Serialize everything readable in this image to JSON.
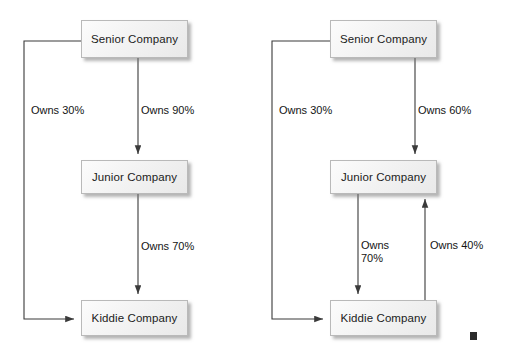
{
  "diagram": {
    "line_color": "#3a3a3a",
    "box_fill": "#f2f2f2",
    "box_border": "#b9b9b9",
    "text_color": "#1b1b1b",
    "panels": [
      {
        "id": "left-panel",
        "name": "left-diagram",
        "nodes": [
          {
            "id": "left-senior",
            "label": "Senior Company"
          },
          {
            "id": "left-junior",
            "label": "Junior Company"
          },
          {
            "id": "left-kiddie",
            "label": "Kiddie Company"
          }
        ],
        "edges": [
          {
            "id": "left-senior-kiddie",
            "from": "Senior Company",
            "to": "Kiddie Company",
            "label": "Owns 30%",
            "percent": 30
          },
          {
            "id": "left-senior-junior",
            "from": "Senior Company",
            "to": "Junior Company",
            "label": "Owns 90%",
            "percent": 90
          },
          {
            "id": "left-junior-kiddie",
            "from": "Junior Company",
            "to": "Kiddie Company",
            "label": "Owns 70%",
            "percent": 70
          }
        ]
      },
      {
        "id": "right-panel",
        "name": "right-diagram",
        "nodes": [
          {
            "id": "right-senior",
            "label": "Senior Company"
          },
          {
            "id": "right-junior",
            "label": "Junior Company"
          },
          {
            "id": "right-kiddie",
            "label": "Kiddie Company"
          }
        ],
        "edges": [
          {
            "id": "right-senior-kiddie",
            "from": "Senior Company",
            "to": "Kiddie Company",
            "label": "Owns 30%",
            "percent": 30
          },
          {
            "id": "right-senior-junior",
            "from": "Senior Company",
            "to": "Junior Company",
            "label": "Owns 60%",
            "percent": 60
          },
          {
            "id": "right-junior-kiddie",
            "from": "Junior Company",
            "to": "Kiddie Company",
            "label": "Owns\n70%",
            "percent": 70
          },
          {
            "id": "right-kiddie-junior",
            "from": "Kiddie Company",
            "to": "Junior Company",
            "label": "Owns 40%",
            "percent": 40
          }
        ]
      }
    ],
    "marker": {
      "id": "end-marker",
      "shape": "filled-square"
    }
  }
}
